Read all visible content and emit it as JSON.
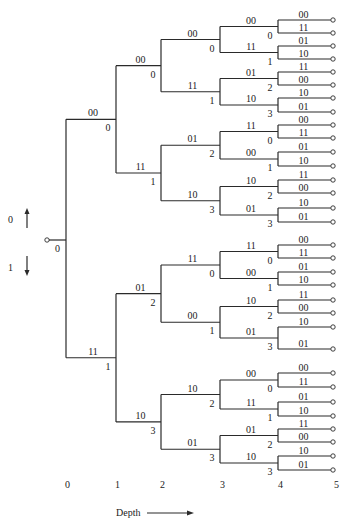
{
  "legend": {
    "up_label": "0",
    "down_label": "1",
    "root_state": "0"
  },
  "depth_axis": {
    "label": "Depth",
    "ticks": [
      "0",
      "1",
      "2",
      "3",
      "4",
      "5"
    ]
  },
  "colors": {
    "line": "#2a2a2a",
    "text": "#222222",
    "background": "#ffffff"
  },
  "tree": {
    "root": {
      "state": "0"
    },
    "depth1": [
      {
        "output": "00",
        "state": "0"
      },
      {
        "output": "11",
        "state": "1"
      }
    ],
    "depth2": [
      {
        "output": "00",
        "state": "0"
      },
      {
        "output": "11",
        "state": "1"
      },
      {
        "output": "01",
        "state": "2"
      },
      {
        "output": "10",
        "state": "3"
      }
    ],
    "depth3": [
      {
        "output": "00",
        "state": "0"
      },
      {
        "output": "11",
        "state": "1"
      },
      {
        "output": "01",
        "state": "2"
      },
      {
        "output": "10",
        "state": "3"
      },
      {
        "output": "11",
        "state": "0"
      },
      {
        "output": "00",
        "state": "1"
      },
      {
        "output": "10",
        "state": "2"
      },
      {
        "output": "01",
        "state": "3"
      }
    ],
    "depth4": [
      {
        "output": "00",
        "state": "0"
      },
      {
        "output": "11",
        "state": "1"
      },
      {
        "output": "01",
        "state": "2"
      },
      {
        "output": "10",
        "state": "3"
      },
      {
        "output": "11",
        "state": "0"
      },
      {
        "output": "00",
        "state": "1"
      },
      {
        "output": "10",
        "state": "2"
      },
      {
        "output": "01",
        "state": "3"
      },
      {
        "output": "11",
        "state": "0"
      },
      {
        "output": "00",
        "state": "1"
      },
      {
        "output": "10",
        "state": "2"
      },
      {
        "output": "01",
        "state": "3"
      },
      {
        "output": "00",
        "state": "0"
      },
      {
        "output": "11",
        "state": "1"
      },
      {
        "output": "01",
        "state": "2"
      },
      {
        "output": "10",
        "state": "3"
      }
    ],
    "depth5_outputs": [
      "00",
      "11",
      "01",
      "10",
      "11",
      "00",
      "10",
      "01",
      "00",
      "11",
      "01",
      "10",
      "11",
      "00",
      "10",
      "01",
      "00",
      "11",
      "01",
      "10",
      "11",
      "00",
      "10",
      "01",
      "00",
      "11",
      "01",
      "10",
      "11",
      "00",
      "10",
      "01"
    ]
  }
}
